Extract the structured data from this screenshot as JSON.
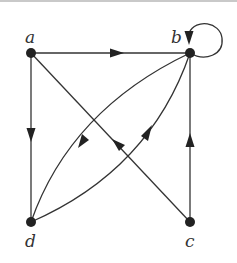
{
  "graph": {
    "type": "directed",
    "nodes": [
      {
        "id": "a",
        "label": "a"
      },
      {
        "id": "b",
        "label": "b"
      },
      {
        "id": "c",
        "label": "c"
      },
      {
        "id": "d",
        "label": "d"
      }
    ],
    "edges": [
      {
        "from": "a",
        "to": "b"
      },
      {
        "from": "a",
        "to": "d"
      },
      {
        "from": "c",
        "to": "a"
      },
      {
        "from": "c",
        "to": "b"
      },
      {
        "from": "b",
        "to": "d"
      },
      {
        "from": "d",
        "to": "b"
      },
      {
        "from": "b",
        "to": "b"
      }
    ]
  }
}
